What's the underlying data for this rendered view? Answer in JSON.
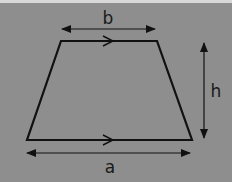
{
  "diagram": {
    "shape": "trapezoid",
    "background_color": "#8e8e8e",
    "stroke_color": "#111111",
    "labels": {
      "top_side": "b",
      "height": "h",
      "bottom_side": "a"
    },
    "parallel_marks": [
      ">",
      ">"
    ]
  }
}
